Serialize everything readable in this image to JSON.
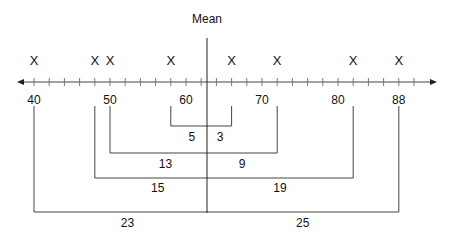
{
  "title": "Mean",
  "axis": {
    "min": 40,
    "max": 88,
    "tick_step": 2,
    "tick_labels": [
      "40",
      "50",
      "60",
      "70",
      "80",
      "88"
    ],
    "tick_label_values": [
      40,
      50,
      60,
      70,
      80,
      88
    ]
  },
  "mean_value": 63,
  "points": [
    40,
    48,
    50,
    58,
    66,
    72,
    82,
    88
  ],
  "point_marker": "X",
  "brackets": [
    {
      "left": 58,
      "right": 66,
      "left_label": "5",
      "right_label": "3"
    },
    {
      "left": 50,
      "right": 72,
      "left_label": "13",
      "right_label": "9"
    },
    {
      "left": 48,
      "right": 82,
      "left_label": "15",
      "right_label": "19"
    },
    {
      "left": 40,
      "right": 88,
      "left_label": "23",
      "right_label": "25"
    }
  ],
  "chart_data": {
    "type": "diagram",
    "title": "Mean",
    "x": [
      40,
      48,
      50,
      58,
      66,
      72,
      82,
      88
    ],
    "mean": 63,
    "deviations": [
      23,
      15,
      13,
      5,
      3,
      9,
      19,
      25
    ],
    "axis_range": [
      40,
      88
    ],
    "tick_labels": [
      "40",
      "50",
      "60",
      "70",
      "80",
      "88"
    ]
  }
}
